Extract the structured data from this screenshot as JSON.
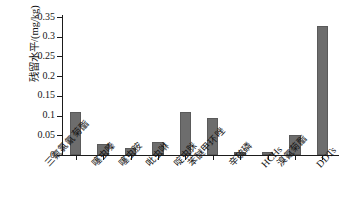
{
  "chart_data": {
    "type": "bar",
    "title": "",
    "xlabel": "",
    "ylabel": "残留水平/(mg/kg)",
    "ylim": [
      0,
      0.35
    ],
    "grid": false,
    "legend": "none",
    "yticks": [
      "0",
      "0.05",
      "0.1",
      "0.15",
      "0.2",
      "0.25",
      "0.3",
      "0.35"
    ],
    "ytick_values": [
      0,
      0.05,
      0.1,
      0.15,
      0.2,
      0.25,
      0.3,
      0.35
    ],
    "categories": [
      "三氟氯氰菊酯",
      "噻虫嗪",
      "噻虫胺",
      "吡虫啉",
      "啶虫脒",
      "苯醚甲环唑",
      "辛硫磷",
      "HCHs",
      "溴氰菊酯",
      "DDTs"
    ],
    "values": [
      0.109,
      0.029,
      0.019,
      0.034,
      0.109,
      0.093,
      0.008,
      0.008,
      0.052,
      0.328
    ],
    "bar_color": "#6d6d6d",
    "axis_color": "#1b1b1b",
    "background": "#ffffff"
  }
}
